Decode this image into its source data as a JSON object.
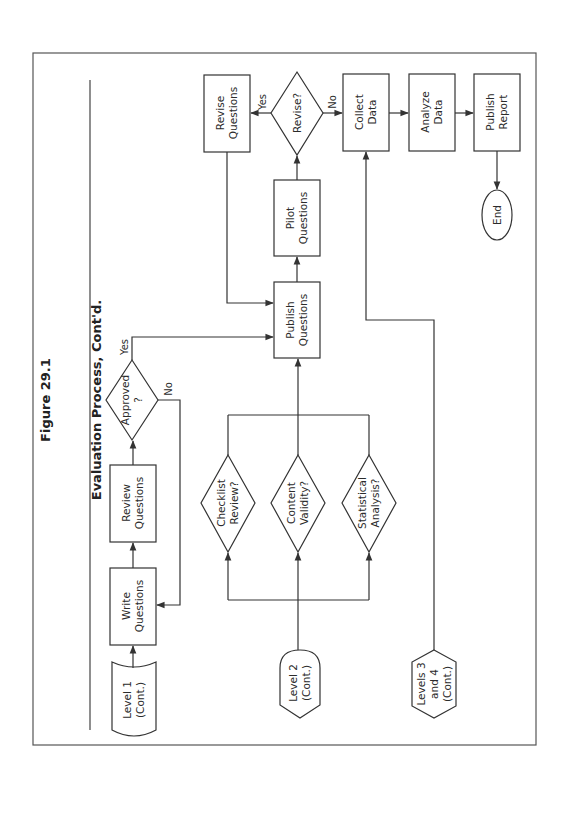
{
  "figure": {
    "number": "Figure 29.1",
    "title": "Evaluation Process, Cont'd."
  },
  "colors": {
    "stroke": "#333333",
    "background": "#ffffff",
    "text": "#2b2b2b"
  },
  "nodes": {
    "level1": {
      "label": "Level 1\n(Cont.)",
      "shape": "cylinder-terminator"
    },
    "write_questions": {
      "label": "Write\nQuestions",
      "shape": "process"
    },
    "review_questions": {
      "label": "Review\nQuestions",
      "shape": "process"
    },
    "approved": {
      "label": "Approved\n?",
      "shape": "decision"
    },
    "level2": {
      "label": "Level 2\n(Cont.)",
      "shape": "display"
    },
    "checklist_review": {
      "label": "Checklist\nReview?",
      "shape": "decision"
    },
    "content_validity": {
      "label": "Content\nValidity?",
      "shape": "decision"
    },
    "statistical_analysis": {
      "label": "Statistical\nAnalysis?",
      "shape": "decision"
    },
    "publish_questions": {
      "label": "Publish\nQuestions",
      "shape": "process"
    },
    "pilot_questions": {
      "label": "Pilot\nQuestions",
      "shape": "process"
    },
    "revise": {
      "label": "Revise?",
      "shape": "decision"
    },
    "revise_questions": {
      "label": "Revise\nQuestions",
      "shape": "process"
    },
    "levels34": {
      "label": "Levels 3\nand 4\n(Cont.)",
      "shape": "hexagon"
    },
    "collect_data": {
      "label": "Collect\nData",
      "shape": "process"
    },
    "analyze_data": {
      "label": "Analyze\nData",
      "shape": "process"
    },
    "publish_report": {
      "label": "Publish\nReport",
      "shape": "process"
    },
    "end": {
      "label": "End",
      "shape": "terminator"
    }
  },
  "edge_labels": {
    "approved_yes": "Yes",
    "approved_no": "No",
    "revise_yes": "Yes",
    "revise_no": "No"
  },
  "edges": [
    {
      "from": "Level 1 (Cont.)",
      "to": "Write Questions"
    },
    {
      "from": "Write Questions",
      "to": "Review Questions"
    },
    {
      "from": "Review Questions",
      "to": "Approved ?"
    },
    {
      "from": "Approved ?",
      "to": "Publish Questions",
      "label": "Yes"
    },
    {
      "from": "Approved ?",
      "to": "Write Questions",
      "label": "No"
    },
    {
      "from": "Level 2 (Cont.)",
      "to": "Checklist Review?"
    },
    {
      "from": "Level 2 (Cont.)",
      "to": "Content Validity?"
    },
    {
      "from": "Level 2 (Cont.)",
      "to": "Statistical Analysis?"
    },
    {
      "from": "Checklist Review?",
      "to": "Publish Questions"
    },
    {
      "from": "Content Validity?",
      "to": "Publish Questions"
    },
    {
      "from": "Statistical Analysis?",
      "to": "Publish Questions"
    },
    {
      "from": "Publish Questions",
      "to": "Pilot Questions"
    },
    {
      "from": "Pilot Questions",
      "to": "Revise?"
    },
    {
      "from": "Revise?",
      "to": "Revise Questions",
      "label": "Yes"
    },
    {
      "from": "Revise Questions",
      "to": "Publish Questions"
    },
    {
      "from": "Revise?",
      "to": "Collect Data",
      "label": "No"
    },
    {
      "from": "Levels 3 and 4 (Cont.)",
      "to": "Collect Data"
    },
    {
      "from": "Collect Data",
      "to": "Analyze Data"
    },
    {
      "from": "Analyze Data",
      "to": "Publish Report"
    },
    {
      "from": "Publish Report",
      "to": "End"
    }
  ]
}
